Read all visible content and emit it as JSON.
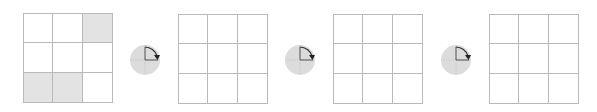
{
  "diagram": {
    "colors": {
      "grid_line": "#b9b9b9",
      "shaded_cell": "#e3e3e3",
      "rotation_disc": "#dcdcdc",
      "rotation_arrow": "#333333"
    },
    "grids": [
      {
        "id": "grid-1",
        "rows": 3,
        "cols": 3,
        "cells": [
          0,
          0,
          1,
          0,
          0,
          0,
          1,
          1,
          0
        ]
      },
      {
        "id": "grid-2",
        "rows": 3,
        "cols": 3,
        "cells": [
          0,
          0,
          0,
          0,
          0,
          0,
          0,
          0,
          0
        ]
      },
      {
        "id": "grid-3",
        "rows": 3,
        "cols": 3,
        "cells": [
          0,
          0,
          0,
          0,
          0,
          0,
          0,
          0,
          0
        ]
      },
      {
        "id": "grid-4",
        "rows": 3,
        "cols": 3,
        "cells": [
          0,
          0,
          0,
          0,
          0,
          0,
          0,
          0,
          0
        ]
      }
    ],
    "rotations": [
      {
        "icon": "rotate-clockwise-90-icon",
        "direction": "clockwise",
        "degrees": 90
      },
      {
        "icon": "rotate-clockwise-90-icon",
        "direction": "clockwise",
        "degrees": 90
      },
      {
        "icon": "rotate-clockwise-90-icon",
        "direction": "clockwise",
        "degrees": 90
      }
    ]
  }
}
